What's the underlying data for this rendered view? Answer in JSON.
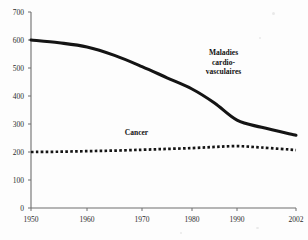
{
  "chart_data": {
    "type": "line",
    "title": "",
    "subtitle": "",
    "xlabel": "",
    "ylabel": "",
    "xlim": [
      1950,
      2002
    ],
    "ylim": [
      0,
      700
    ],
    "grid": false,
    "legend_position": "inline-annotations",
    "x_ticks": [
      1950,
      1960,
      1970,
      1980,
      1990,
      2002
    ],
    "x_tick_labels": [
      "1950",
      "1960",
      "1970",
      "1980",
      "1990",
      "2002"
    ],
    "y_ticks": [
      0,
      100,
      200,
      300,
      400,
      500,
      600,
      700
    ],
    "y_tick_labels": [
      "0",
      "100",
      "200",
      "300",
      "400",
      "500",
      "600",
      "700"
    ],
    "series": [
      {
        "name": "Maladies cardio-vasculaires",
        "label_lines": [
          "Maladies",
          "cardio-",
          "vasculaires"
        ],
        "style": "solid-thick",
        "color": "#141414",
        "x": [
          1950,
          1955,
          1960,
          1965,
          1970,
          1975,
          1980,
          1985,
          1990,
          1995,
          2002
        ],
        "values": [
          600,
          590,
          575,
          545,
          505,
          465,
          425,
          375,
          314,
          288,
          260
        ]
      },
      {
        "name": "Cancer",
        "label_lines": [
          "Cancer"
        ],
        "style": "dotted",
        "color": "#141414",
        "x": [
          1950,
          1955,
          1960,
          1965,
          1970,
          1975,
          1980,
          1985,
          1990,
          1995,
          2002
        ],
        "values": [
          200,
          201,
          203,
          205,
          208,
          211,
          214,
          218,
          221,
          216,
          207
        ]
      }
    ],
    "annotations": [
      {
        "text": "Maladies cardio-vasculaires",
        "x": 1987,
        "y": 545
      },
      {
        "text": "Cancer",
        "x": 1969,
        "y": 262
      }
    ]
  },
  "axis_color": "#6e6e6e",
  "text_color": "#2b2b2b"
}
